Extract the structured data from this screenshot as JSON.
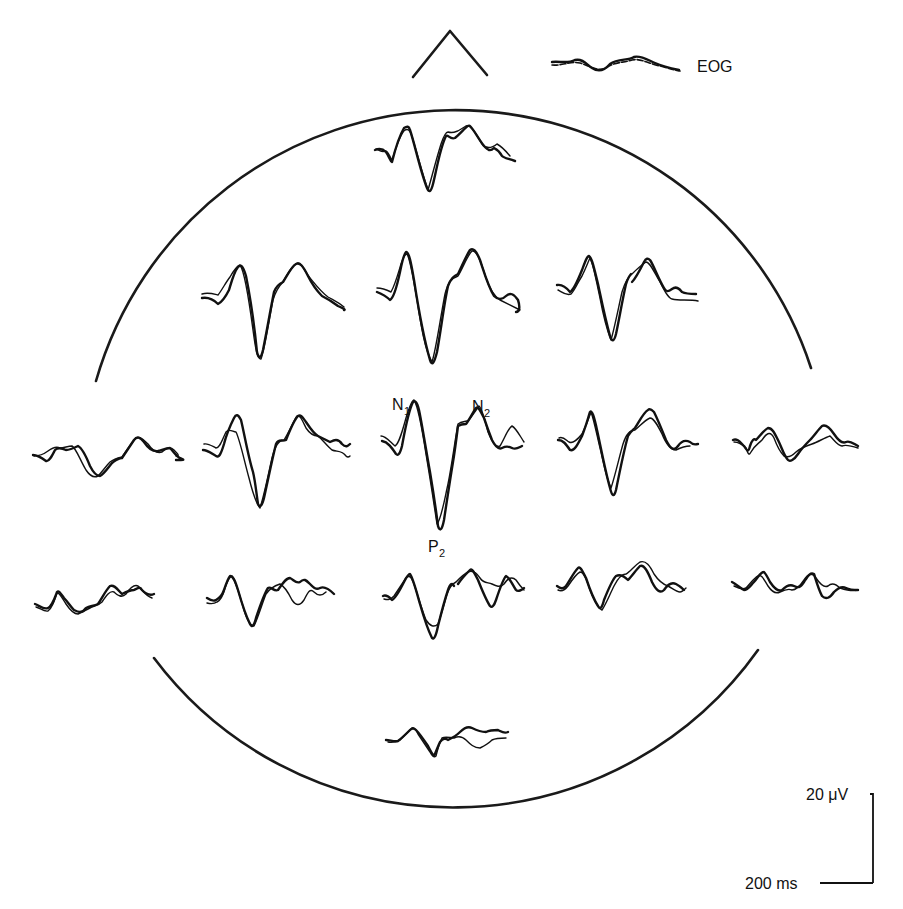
{
  "figure": {
    "colors": {
      "ink": "#111111",
      "background": "#ffffff"
    }
  },
  "labels": {
    "eog": "EOG",
    "n1_main": "N",
    "n1_sub": "1",
    "n2_main": "N",
    "n2_sub": "2",
    "p2_main": "P",
    "p2_sub": "2"
  },
  "scale_bar": {
    "amplitude_label": "20 μV",
    "time_label": "200 ms",
    "amplitude_value": 20,
    "amplitude_unit": "μV",
    "time_value": 200,
    "time_unit": "ms"
  },
  "head": {
    "nose": "triangle",
    "outline": "circle with side gaps"
  },
  "channels": [
    {
      "id": "eog",
      "row": 0,
      "col": "right-top",
      "x": 550,
      "y": 66
    },
    {
      "id": "fz-row0",
      "row": 1,
      "col": 3,
      "x": 375,
      "y": 150
    },
    {
      "id": "r2c2",
      "row": 2,
      "col": 2,
      "x": 202,
      "y": 298
    },
    {
      "id": "r2c3",
      "row": 2,
      "col": 3,
      "x": 377,
      "y": 292
    },
    {
      "id": "r2c4",
      "row": 2,
      "col": 4,
      "x": 557,
      "y": 285
    },
    {
      "id": "r3c1",
      "row": 3,
      "col": 1,
      "x": 33,
      "y": 455
    },
    {
      "id": "r3c2",
      "row": 3,
      "col": 2,
      "x": 203,
      "y": 450
    },
    {
      "id": "r3c3",
      "row": 3,
      "col": 3,
      "x": 380,
      "y": 438
    },
    {
      "id": "r3c4",
      "row": 3,
      "col": 4,
      "x": 558,
      "y": 440
    },
    {
      "id": "r3c5",
      "row": 3,
      "col": 5,
      "x": 732,
      "y": 440
    },
    {
      "id": "r4c1",
      "row": 4,
      "col": 1,
      "x": 35,
      "y": 605
    },
    {
      "id": "r4c2",
      "row": 4,
      "col": 2,
      "x": 205,
      "y": 600
    },
    {
      "id": "r4c3",
      "row": 4,
      "col": 3,
      "x": 383,
      "y": 596
    },
    {
      "id": "r4c4",
      "row": 4,
      "col": 4,
      "x": 556,
      "y": 586
    },
    {
      "id": "r4c5",
      "row": 4,
      "col": 5,
      "x": 732,
      "y": 586
    },
    {
      "id": "bottom",
      "row": 5,
      "col": 3,
      "x": 386,
      "y": 740
    }
  ]
}
